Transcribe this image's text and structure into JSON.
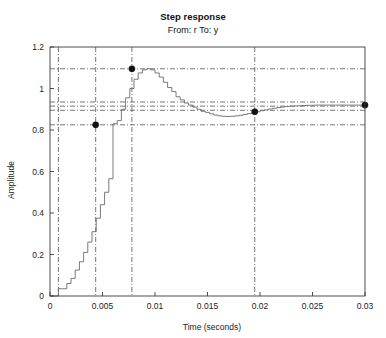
{
  "chart_data": {
    "type": "line",
    "title": "Step response",
    "subtitle": "From: r To: y",
    "xlabel": "Time (seconds)",
    "ylabel": "Amplitude",
    "xlim": [
      0,
      0.03
    ],
    "ylim": [
      0,
      1.2
    ],
    "xticks": [
      0,
      0.005,
      0.01,
      0.015,
      0.02,
      0.025,
      0.03
    ],
    "xticklabels": [
      "0",
      "0.005",
      "0.01",
      "0.015",
      "0.02",
      "0.025",
      "0.03"
    ],
    "yticks": [
      0,
      0.2,
      0.4,
      0.6,
      0.8,
      1,
      1.2
    ],
    "yticklabels": [
      "0",
      "0.2",
      "0.4",
      "0.6",
      "0.8",
      "1",
      "1.2"
    ],
    "grid": false,
    "legend": null,
    "style": "staircase",
    "sample_period": 0.0004,
    "series": [
      {
        "name": "y",
        "drawstyle": "steps-post",
        "x": [
          0,
          0.0004,
          0.0008,
          0.0012,
          0.0016,
          0.002,
          0.0024,
          0.0028,
          0.0032,
          0.0036,
          0.004,
          0.0044,
          0.0048,
          0.0052,
          0.0056,
          0.006,
          0.0064,
          0.0068,
          0.0072,
          0.0076,
          0.008,
          0.0084,
          0.0088,
          0.0092,
          0.0096,
          0.01,
          0.0104,
          0.0108,
          0.0112,
          0.0116,
          0.012,
          0.0124,
          0.0128,
          0.0132,
          0.0136,
          0.014,
          0.0144,
          0.0148,
          0.0152,
          0.0156,
          0.016,
          0.0164,
          0.0168,
          0.0172,
          0.0176,
          0.018,
          0.0184,
          0.0188,
          0.0192,
          0.0196,
          0.02,
          0.0204,
          0.0208,
          0.0212,
          0.0216,
          0.022,
          0.0224,
          0.0228,
          0.0232,
          0.0236,
          0.024,
          0.0244,
          0.0248,
          0.0252,
          0.0256,
          0.026,
          0.0264,
          0.0268,
          0.0272,
          0.0276,
          0.028,
          0.0284,
          0.0288,
          0.0292,
          0.0296,
          0.03
        ],
        "y": [
          0.0,
          0.0,
          0.035,
          0.035,
          0.06,
          0.085,
          0.125,
          0.165,
          0.21,
          0.26,
          0.31,
          0.375,
          0.44,
          0.5,
          0.565,
          0.83,
          0.845,
          0.9,
          0.955,
          1.0,
          1.045,
          1.075,
          1.09,
          1.095,
          1.09,
          1.075,
          1.055,
          1.03,
          1.005,
          0.985,
          0.96,
          0.945,
          0.93,
          0.92,
          0.91,
          0.9,
          0.89,
          0.885,
          0.878,
          0.872,
          0.868,
          0.866,
          0.865,
          0.866,
          0.868,
          0.871,
          0.875,
          0.879,
          0.884,
          0.888,
          0.893,
          0.897,
          0.901,
          0.905,
          0.908,
          0.911,
          0.913,
          0.915,
          0.916,
          0.917,
          0.918,
          0.919,
          0.919,
          0.92,
          0.92,
          0.92,
          0.92,
          0.92,
          0.92,
          0.92,
          0.92,
          0.92,
          0.92,
          0.92,
          0.92,
          0.92
        ]
      }
    ],
    "guide_lines_horizontal": [
      {
        "label": "peak-value",
        "value": 1.095
      },
      {
        "label": "settle-upper",
        "value": 0.935
      },
      {
        "label": "final-value",
        "value": 0.915
      },
      {
        "label": "settle-lower",
        "value": 0.895
      },
      {
        "label": "rise-end",
        "value": 0.825
      }
    ],
    "guide_lines_vertical": [
      {
        "label": "rise-start",
        "value": 0.0008
      },
      {
        "label": "rise-time",
        "value": 0.00435
      },
      {
        "label": "peak-time",
        "value": 0.0078
      },
      {
        "label": "settling-time",
        "value": 0.0195
      }
    ],
    "markers": [
      {
        "label": "rise-time-marker",
        "x": 0.00435,
        "y": 0.825
      },
      {
        "label": "peak-marker",
        "x": 0.0078,
        "y": 1.095
      },
      {
        "label": "settling-time-marker",
        "x": 0.0195,
        "y": 0.888
      },
      {
        "label": "final-value-marker",
        "x": 0.03,
        "y": 0.92
      }
    ]
  },
  "colors": {
    "curve": "#6b6b6b",
    "frame": "#3a3a3a",
    "guide": "#555555",
    "marker": "#111111",
    "background": "#ffffff"
  }
}
